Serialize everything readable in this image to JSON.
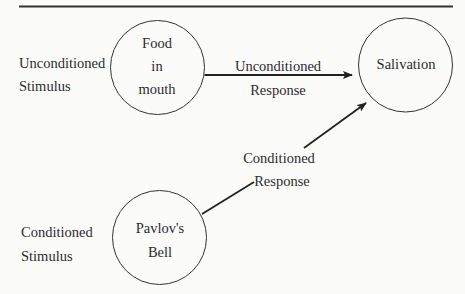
{
  "figure": {
    "stimuli": {
      "unconditioned": {
        "line1": "Unconditioned",
        "line2": "Stimulus"
      },
      "conditioned": {
        "line1": "Conditioned",
        "line2": "Stimulus"
      }
    },
    "nodes": {
      "food": {
        "line1": "Food",
        "line2": "in",
        "line3": "mouth"
      },
      "salivation": {
        "label": "Salivation"
      },
      "bell": {
        "line1": "Pavlov's",
        "line2": "Bell"
      }
    },
    "edges": {
      "unconditioned_response": {
        "line1": "Unconditioned",
        "line2": "Response"
      },
      "conditioned_response": {
        "line1": "Conditioned",
        "line2": "Response"
      }
    },
    "colors": {
      "ink": "#2b2b2b",
      "background": "#fbfbfa"
    }
  }
}
